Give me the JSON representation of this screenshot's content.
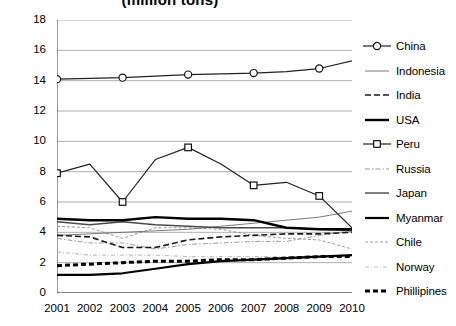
{
  "chart": {
    "title": "(million tons)",
    "xlabel": "",
    "ylabel": ""
  },
  "axis": {
    "y_ticks": [
      "18",
      "16",
      "14",
      "12",
      "10",
      "8",
      "6",
      "4",
      "2",
      "0"
    ],
    "x_ticks": [
      "2001",
      "2002",
      "2003",
      "2004",
      "2005",
      "2006",
      "2007",
      "2008",
      "2009",
      "2010"
    ]
  },
  "legend": {
    "items": [
      {
        "label": "China",
        "key": "line-circle-marker"
      },
      {
        "label": "Indonesia",
        "key": "line-thin"
      },
      {
        "label": "India",
        "key": "line-dashed"
      },
      {
        "label": "USA",
        "key": "line-thick"
      },
      {
        "label": "Peru",
        "key": "line-square-marker"
      },
      {
        "label": "Russia",
        "key": "line-dashdot-gray"
      },
      {
        "label": "Japan",
        "key": "line-medium"
      },
      {
        "label": "Myanmar",
        "key": "line-thick"
      },
      {
        "label": "Chile",
        "key": "line-fine-dashed"
      },
      {
        "label": "Norway",
        "key": "line-light-dashdot"
      },
      {
        "label": "Phillipines",
        "key": "line-thick-dashed"
      }
    ]
  },
  "chart_data": {
    "type": "line",
    "title": "(million tons)",
    "xlabel": "",
    "ylabel": "",
    "ylim": [
      0,
      18
    ],
    "ytick_step": 2,
    "grid": true,
    "legend_position": "right",
    "x": [
      2001,
      2002,
      2003,
      2004,
      2005,
      2006,
      2007,
      2008,
      2009,
      2010
    ],
    "categories": [
      "2001",
      "2002",
      "2003",
      "2004",
      "2005",
      "2006",
      "2007",
      "2008",
      "2009",
      "2010"
    ],
    "series": [
      {
        "name": "China",
        "values": [
          14.1,
          14.15,
          14.2,
          14.3,
          14.4,
          14.45,
          14.5,
          14.6,
          14.8,
          15.3
        ]
      },
      {
        "name": "Indonesia",
        "values": [
          3.8,
          3.9,
          4.0,
          4.1,
          4.2,
          4.4,
          4.6,
          4.8,
          5.0,
          5.4
        ]
      },
      {
        "name": "India",
        "values": [
          3.8,
          3.7,
          3.0,
          3.0,
          3.5,
          3.7,
          3.8,
          3.9,
          3.9,
          4.0
        ]
      },
      {
        "name": "USA",
        "values": [
          4.9,
          4.8,
          4.8,
          5.0,
          4.9,
          4.9,
          4.8,
          4.3,
          4.2,
          4.2
        ]
      },
      {
        "name": "Peru",
        "values": [
          7.9,
          8.5,
          6.0,
          8.8,
          9.6,
          8.5,
          7.1,
          7.3,
          6.4,
          4.3
        ]
      },
      {
        "name": "Russia",
        "values": [
          3.6,
          3.3,
          3.3,
          2.9,
          3.2,
          3.3,
          3.4,
          3.4,
          3.8,
          4.1
        ]
      },
      {
        "name": "Japan",
        "values": [
          4.7,
          4.5,
          4.7,
          4.5,
          4.4,
          4.3,
          4.3,
          4.3,
          4.2,
          4.1
        ]
      },
      {
        "name": "Myanmar",
        "values": [
          1.2,
          1.2,
          1.3,
          1.6,
          1.9,
          2.1,
          2.2,
          2.3,
          2.4,
          2.5
        ]
      },
      {
        "name": "Chile",
        "values": [
          4.4,
          4.3,
          3.6,
          4.3,
          4.3,
          4.2,
          3.8,
          3.6,
          3.5,
          2.9
        ]
      },
      {
        "name": "Norway",
        "values": [
          2.7,
          2.5,
          2.5,
          2.5,
          2.4,
          2.4,
          2.4,
          2.4,
          2.4,
          2.5
        ]
      },
      {
        "name": "Phillipines",
        "values": [
          1.8,
          1.9,
          2.0,
          2.1,
          2.1,
          2.2,
          2.2,
          2.3,
          2.4,
          2.4
        ]
      }
    ]
  }
}
